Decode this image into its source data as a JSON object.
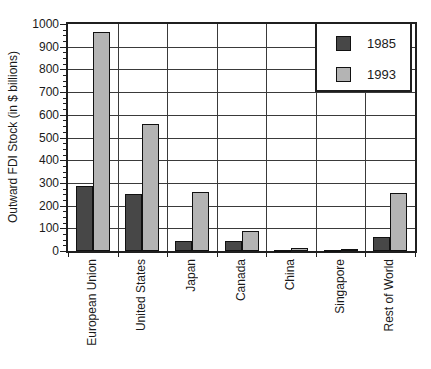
{
  "chart_data": {
    "type": "bar",
    "title": "",
    "categories": [
      "European Union",
      "United States",
      "Japan",
      "Canada",
      "China",
      "Singapore",
      "Rest of World"
    ],
    "series": [
      {
        "name": "1985",
        "color": "#474747",
        "values": [
          285,
          251,
          44,
          43,
          2,
          1,
          60
        ]
      },
      {
        "name": "1993",
        "color": "#b4b4b4",
        "values": [
          965,
          560,
          260,
          87,
          15,
          10,
          255
        ]
      }
    ],
    "xlabel": "",
    "ylabel": "Outward FDI Stock (in $ billions)",
    "ylim": [
      0,
      1000
    ],
    "ytick_step": 100,
    "y_minor_tick_step": 25,
    "ytick_labels": [
      "0",
      "100",
      "200",
      "300",
      "400",
      "500",
      "600",
      "700",
      "800",
      "900",
      "1000"
    ],
    "grid": true,
    "legend_position": "top-right",
    "bar_border_color": "#111111",
    "grid_color": "#3a3a3a"
  }
}
